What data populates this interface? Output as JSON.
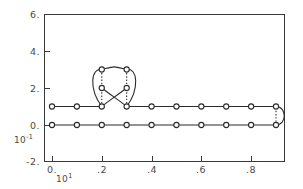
{
  "chart_data": {
    "type": "line",
    "title": "",
    "xlabel": "",
    "ylabel": "",
    "x_exponent_label": "10",
    "x_exponent_sup": "1",
    "y_exponent_label": "10",
    "y_exponent_sup": "-1",
    "xlim": [
      -0.05,
      0.97
    ],
    "ylim": [
      -2.0,
      6.0
    ],
    "xticks": [
      0.0,
      0.2,
      0.4,
      0.6,
      0.8
    ],
    "xticklabels": [
      "0.",
      ".2",
      ".4",
      ".6",
      ".8"
    ],
    "yticks": [
      -2.0,
      0.0,
      2.0,
      4.0,
      6.0
    ],
    "yticklabels": [
      "-2.",
      "0.",
      "2.",
      "4.",
      "6."
    ],
    "grid": false,
    "legend": "none",
    "marker": "open-circle",
    "series": [
      {
        "name": "lower-branch",
        "comment": "flat branch at y=0 from x=0 to x=0.9",
        "x": [
          0.0,
          0.1,
          0.2,
          0.3,
          0.4,
          0.5,
          0.6,
          0.7,
          0.8,
          0.9
        ],
        "y": [
          0.0,
          0.0,
          0.0,
          0.0,
          0.0,
          0.0,
          0.0,
          0.0,
          0.0,
          0.0
        ]
      },
      {
        "name": "upper-branch",
        "comment": "flat branch at y=1 from x=0 to x=0.9",
        "x": [
          0.0,
          0.1,
          0.2,
          0.3,
          0.4,
          0.5,
          0.6,
          0.7,
          0.8,
          0.9
        ],
        "y": [
          1.0,
          1.0,
          1.0,
          1.0,
          1.0,
          1.0,
          1.0,
          1.0,
          1.0,
          1.0
        ]
      },
      {
        "name": "loop-top",
        "comment": "upper arc of the bowtie loop",
        "x": [
          0.2,
          0.3
        ],
        "y": [
          3.0,
          3.0
        ]
      },
      {
        "name": "loop-middle",
        "comment": "crossing points of the bowtie loop",
        "x": [
          0.2,
          0.3
        ],
        "y": [
          2.0,
          2.0
        ]
      }
    ],
    "annotations": [
      {
        "name": "right-cap",
        "comment": "semicircular turning point joining y=0 and y=1 at x=0.9"
      },
      {
        "name": "bowtie-crossing",
        "comment": "branches cross near x=0.25, y=1.0"
      }
    ]
  }
}
